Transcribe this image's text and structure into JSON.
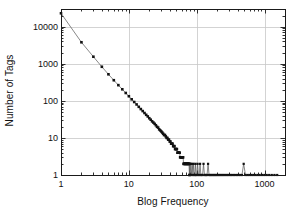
{
  "chart_data": {
    "type": "scatter",
    "title": "",
    "subtitle": "",
    "xlabel": "Blog Frequency",
    "ylabel": "Number of Tags",
    "xscale": "log",
    "yscale": "log",
    "xlim": [
      1,
      2000
    ],
    "ylim": [
      1,
      30000
    ],
    "xticks": [
      1,
      10,
      100,
      1000
    ],
    "xtick_labels": [
      "1",
      "10",
      "100",
      "1000"
    ],
    "yticks": [
      1,
      10,
      100,
      1000,
      10000
    ],
    "ytick_labels": [
      "1",
      "10",
      "100",
      "1000",
      "10000"
    ],
    "grid": true,
    "grid_color": "#c8c8c8",
    "legend": null,
    "marker": "square",
    "marker_color": "#111111",
    "line_color": "#555555",
    "annotations": [],
    "x": [
      1,
      2,
      3,
      4,
      5,
      6,
      7,
      8,
      9,
      10,
      11,
      12,
      13,
      14,
      15,
      16,
      17,
      18,
      19,
      20,
      21,
      22,
      23,
      24,
      25,
      26,
      27,
      28,
      29,
      30,
      31,
      32,
      33,
      34,
      35,
      36,
      37,
      38,
      39,
      40,
      41,
      42,
      43,
      44,
      45,
      46,
      47,
      48,
      49,
      50,
      51,
      52,
      53,
      54,
      55,
      56,
      57,
      58,
      59,
      60,
      61,
      62,
      63,
      64,
      65,
      66,
      67,
      68,
      69,
      70,
      71,
      72,
      73,
      74,
      75,
      76,
      77,
      78,
      79,
      80,
      82,
      84,
      86,
      88,
      90,
      92,
      94,
      96,
      98,
      100,
      103,
      106,
      109,
      112,
      115,
      118,
      122,
      126,
      130,
      134,
      138,
      142,
      147,
      152,
      157,
      162,
      168,
      174,
      180,
      186,
      193,
      200,
      208,
      216,
      225,
      234,
      244,
      255,
      266,
      278,
      291,
      305,
      320,
      336,
      353,
      372,
      392,
      414,
      438,
      464,
      492,
      523,
      557,
      594,
      635,
      680,
      730,
      785,
      846,
      914,
      990,
      1075,
      1170,
      1277,
      1398,
      1535
    ],
    "y": [
      23000,
      3800,
      1550,
      830,
      520,
      360,
      265,
      205,
      163,
      133,
      110,
      93,
      80,
      69,
      60,
      53,
      47,
      42,
      38,
      34,
      31,
      28,
      26,
      24,
      22,
      20,
      19,
      17,
      16,
      15,
      14,
      13,
      12,
      12,
      11,
      10,
      10,
      9,
      9,
      8,
      8,
      7,
      7,
      7,
      6,
      6,
      6,
      5,
      5,
      5,
      5,
      4,
      4,
      4,
      4,
      4,
      3,
      3,
      3,
      3,
      3,
      3,
      3,
      2,
      2,
      2,
      2,
      2,
      2,
      2,
      2,
      2,
      2,
      2,
      2,
      2,
      2,
      1,
      2,
      1,
      2,
      1,
      2,
      1,
      2,
      1,
      1,
      2,
      1,
      1,
      2,
      1,
      1,
      2,
      1,
      1,
      1,
      2,
      1,
      1,
      1,
      1,
      2,
      1,
      1,
      1,
      1,
      1,
      1,
      1,
      1,
      1,
      1,
      1,
      1,
      1,
      1,
      1,
      1,
      1,
      1,
      1,
      1,
      1,
      1,
      1,
      1,
      1,
      1,
      1,
      2,
      1,
      1,
      1,
      1,
      1,
      1,
      1,
      1,
      1,
      1,
      1,
      1,
      1,
      1,
      1
    ]
  },
  "axes": {
    "plot_left_px": 61,
    "plot_right_px": 285,
    "plot_top_px": 9,
    "plot_bottom_px": 175
  }
}
